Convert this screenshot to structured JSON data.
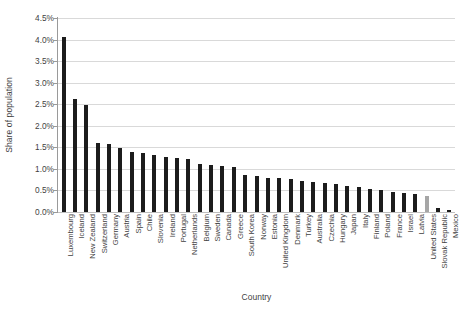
{
  "chart_data": {
    "type": "bar",
    "title": "",
    "xlabel": "Country",
    "ylabel": "Share of population",
    "ylim": [
      0,
      4.5
    ],
    "ytick_labels": [
      "4.5%",
      "4.0%",
      "3.5%",
      "3.0%",
      "2.5%",
      "2.0%",
      "1.5%",
      "1.0%",
      "0.5%",
      "0.0%"
    ],
    "ytick_values": [
      4.5,
      4.0,
      3.5,
      3.0,
      2.5,
      2.0,
      1.5,
      1.0,
      0.5,
      0.0
    ],
    "ytick_format": "percent",
    "grid": true,
    "legend": "none",
    "bar_color": "#1c1c1c",
    "highlight_color": "#a6a6a6",
    "highlight_category": "United States",
    "categories": [
      "Luxembourg",
      "Iceland",
      "New Zealand",
      "Switzerland",
      "Germany",
      "Austria",
      "Spain",
      "Chile",
      "Slovenia",
      "Ireland",
      "Portugal",
      "Netherlands",
      "Belgium",
      "Sweden",
      "Canada",
      "Greece",
      "South Korea",
      "Norway",
      "Estonia",
      "United Kingdom",
      "Denmark",
      "Turkey",
      "Australia",
      "Czechia",
      "Hungary",
      "Japan",
      "Italy",
      "Finland",
      "Poland",
      "France",
      "Israel",
      "Latvia",
      "United States",
      "Slovak Republic",
      "Mexico"
    ],
    "values": [
      4.05,
      2.63,
      2.48,
      1.6,
      1.57,
      1.49,
      1.4,
      1.37,
      1.32,
      1.28,
      1.25,
      1.22,
      1.12,
      1.1,
      1.07,
      1.05,
      0.86,
      0.83,
      0.8,
      0.78,
      0.76,
      0.73,
      0.7,
      0.67,
      0.64,
      0.6,
      0.57,
      0.53,
      0.5,
      0.47,
      0.44,
      0.41,
      0.38,
      0.1,
      0.04
    ]
  }
}
